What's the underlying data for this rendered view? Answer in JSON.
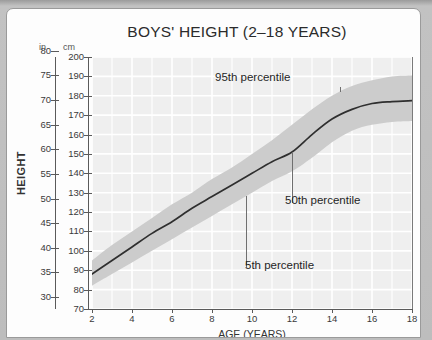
{
  "chart_data": {
    "type": "line",
    "title": "BOYS' HEIGHT (2–18 YEARS)",
    "xlabel": "AGE (YEARS)",
    "ylabel": "HEIGHT",
    "unit_primary_label": "in",
    "unit_secondary_label": "cm",
    "grid": true,
    "legend_position": "inline-annotations",
    "xlim": [
      2,
      18
    ],
    "ylim_cm": [
      70,
      200
    ],
    "ylim_in": [
      27.6,
      78.7
    ],
    "x_ticks": [
      2,
      4,
      6,
      8,
      10,
      12,
      14,
      16,
      18
    ],
    "y_ticks_in": [
      80,
      75,
      70,
      65,
      60,
      55,
      50,
      45,
      40,
      35,
      30
    ],
    "y_ticks_cm": [
      200,
      190,
      180,
      170,
      160,
      150,
      140,
      130,
      120,
      110,
      100,
      90,
      80,
      70
    ],
    "x": [
      2,
      3,
      4,
      5,
      6,
      7,
      8,
      9,
      10,
      11,
      12,
      13,
      14,
      15,
      16,
      17,
      18
    ],
    "series": [
      {
        "name": "95th percentile",
        "unit": "cm",
        "values": [
          95,
          103,
          110,
          117,
          124,
          130,
          137,
          143,
          150,
          157,
          165,
          173,
          180,
          185,
          188,
          190,
          190.5
        ]
      },
      {
        "name": "50th percentile",
        "unit": "cm",
        "values": [
          88,
          95,
          102,
          109,
          115,
          122,
          128,
          134,
          140,
          146,
          151,
          160,
          168,
          173,
          176,
          177,
          177.5
        ]
      },
      {
        "name": "5th percentile",
        "unit": "cm",
        "values": [
          82,
          88,
          94,
          100,
          106,
          112,
          118,
          124,
          130,
          136,
          141,
          148,
          156,
          162,
          165,
          166.5,
          167
        ]
      }
    ],
    "annotations": [
      {
        "text": "95th percentile",
        "points_to_series": "95th percentile",
        "at_age": 14.4
      },
      {
        "text": "50th percentile",
        "points_to_series": "50th percentile",
        "at_age": 12.0
      },
      {
        "text": "5th percentile",
        "points_to_series": "5th percentile",
        "at_age": 9.7
      }
    ],
    "colors": {
      "plot_background": "#efefef",
      "gridline": "#ffffff",
      "band_fill": "#c9c9c9",
      "median_line": "#2f2f2f",
      "axis": "#5a5a5a",
      "text": "#2b2b2b"
    }
  }
}
